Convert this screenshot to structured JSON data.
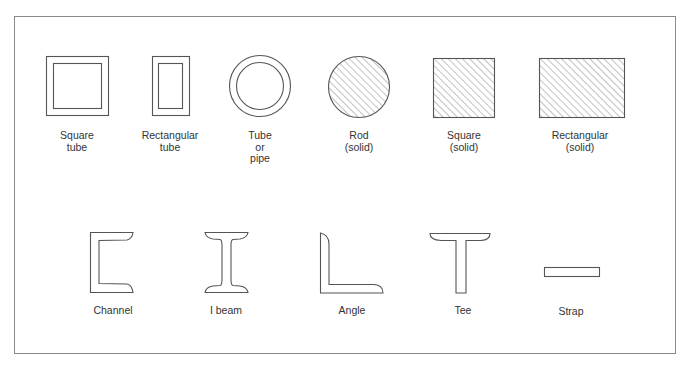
{
  "colors": {
    "stroke": "#555555",
    "hatch": "#777777",
    "frame": "#8a8a8a",
    "text": "#333333"
  },
  "top_row": [
    {
      "id": "square-tube",
      "label": "Square\ntube"
    },
    {
      "id": "rectangular-tube",
      "label": "Rectangular\ntube"
    },
    {
      "id": "tube-pipe",
      "label": "Tube\nor\npipe"
    },
    {
      "id": "rod-solid",
      "label": "Rod\n(solid)"
    },
    {
      "id": "square-solid",
      "label": "Square\n(solid)"
    },
    {
      "id": "rectangular-solid",
      "label": "Rectangular\n(solid)"
    }
  ],
  "bottom_row": [
    {
      "id": "channel",
      "label": "Channel"
    },
    {
      "id": "i-beam",
      "label": "I beam"
    },
    {
      "id": "angle",
      "label": "Angle"
    },
    {
      "id": "tee",
      "label": "Tee"
    },
    {
      "id": "strap",
      "label": "Strap"
    }
  ]
}
